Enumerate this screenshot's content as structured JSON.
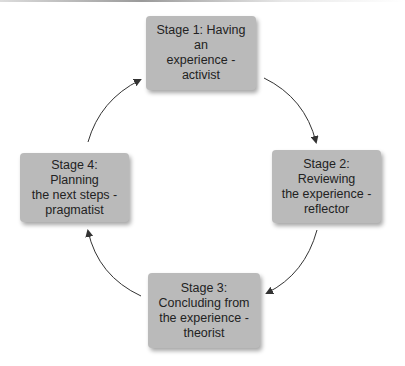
{
  "diagram": {
    "type": "cycle",
    "title": "",
    "stages": [
      {
        "id": 1,
        "lines": [
          "Stage 1: Having an",
          "experience -",
          "activist"
        ],
        "label": "Stage 1: Having an experience - activist"
      },
      {
        "id": 2,
        "lines": [
          "Stage 2: Reviewing",
          "the experience -",
          "reflector"
        ],
        "label": "Stage 2: Reviewing the experience - reflector"
      },
      {
        "id": 3,
        "lines": [
          "Stage 3:",
          "Concluding from",
          "the experience -",
          "theorist"
        ],
        "label": "Stage 3: Concluding from the experience - theorist"
      },
      {
        "id": 4,
        "lines": [
          "Stage 4: Planning",
          "the next steps -",
          "pragmatist"
        ],
        "label": "Stage 4: Planning the next steps - pragmatist"
      }
    ],
    "edges": [
      {
        "from": 1,
        "to": 2
      },
      {
        "from": 2,
        "to": 3
      },
      {
        "from": 3,
        "to": 4
      },
      {
        "from": 4,
        "to": 1
      }
    ],
    "colors": {
      "box_fill": "#bababa",
      "text": "#222222",
      "arrow": "#333333"
    }
  }
}
